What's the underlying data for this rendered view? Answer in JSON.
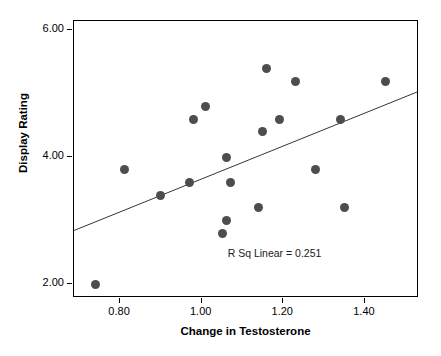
{
  "chart_data": {
    "type": "scatter",
    "title": "",
    "xlabel": "Change in Testosterone",
    "ylabel": "Display Rating",
    "xlim": [
      0.6871,
      1.5325
    ],
    "ylim": [
      1.7797,
      6.1484
    ],
    "xticks": [
      0.8,
      1.0,
      1.2,
      1.4
    ],
    "xtick_labels": [
      "0.80",
      "1.00",
      "1.20",
      "1.40"
    ],
    "yticks": [
      2.0,
      4.0,
      6.0
    ],
    "ytick_labels": [
      "2.00",
      "4.00",
      "6.00"
    ],
    "grid": false,
    "legend": null,
    "marker_color": "#4d4d4d",
    "line_color": "#333333",
    "points": [
      {
        "x": 0.74,
        "y": 2.0
      },
      {
        "x": 0.81,
        "y": 3.8
      },
      {
        "x": 0.9,
        "y": 3.4
      },
      {
        "x": 0.97,
        "y": 3.6
      },
      {
        "x": 0.98,
        "y": 4.6
      },
      {
        "x": 1.01,
        "y": 4.8
      },
      {
        "x": 1.05,
        "y": 2.8
      },
      {
        "x": 1.06,
        "y": 3.0
      },
      {
        "x": 1.06,
        "y": 4.0
      },
      {
        "x": 1.07,
        "y": 3.6
      },
      {
        "x": 1.14,
        "y": 3.2
      },
      {
        "x": 1.15,
        "y": 4.4
      },
      {
        "x": 1.16,
        "y": 5.4
      },
      {
        "x": 1.19,
        "y": 4.6
      },
      {
        "x": 1.23,
        "y": 5.2
      },
      {
        "x": 1.28,
        "y": 3.8
      },
      {
        "x": 1.34,
        "y": 4.6
      },
      {
        "x": 1.35,
        "y": 3.2
      },
      {
        "x": 1.45,
        "y": 5.2
      }
    ],
    "fit_line": {
      "label": "R Sq Linear = 0.251",
      "r_squared": 0.251,
      "x_start": 0.6871,
      "y_start": 2.82,
      "x_end": 1.5325,
      "y_end": 5.02
    },
    "annotations": [
      {
        "text": "R Sq Linear = 0.251",
        "x": 1.24,
        "y": 2.47
      }
    ]
  }
}
